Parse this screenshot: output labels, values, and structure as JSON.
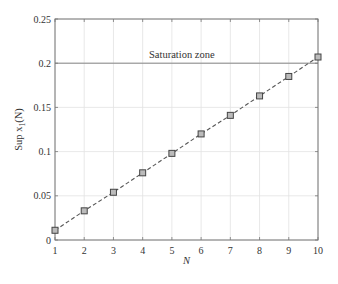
{
  "chart_data": {
    "type": "line",
    "title": "",
    "xlabel": "N",
    "ylabel": "Sup x1(N)",
    "ylabel_main": "Sup x",
    "ylabel_sub": "1",
    "ylabel_tail": "(N)",
    "x": [
      1,
      2,
      3,
      4,
      5,
      6,
      7,
      8,
      9,
      10
    ],
    "series": [
      {
        "name": "Sup x1(N)",
        "values": [
          0.011,
          0.033,
          0.054,
          0.076,
          0.098,
          0.12,
          0.141,
          0.163,
          0.185,
          0.207
        ],
        "line_style": "dashed",
        "marker": "square",
        "color": "#555555"
      }
    ],
    "xlim": [
      1,
      10
    ],
    "ylim": [
      0,
      0.25
    ],
    "xticks": [
      "1",
      "2",
      "3",
      "4",
      "5",
      "6",
      "7",
      "8",
      "9",
      "10"
    ],
    "yticks": [
      "0",
      "0.05",
      "0.1",
      "0.15",
      "0.2",
      "0.25"
    ],
    "grid": true,
    "legend": null,
    "annotations": [
      {
        "text": "Saturation zone",
        "type": "horizontal-line",
        "y": 0.2
      }
    ]
  },
  "colors": {
    "axis": "#777777",
    "grid": "#e2e2e2",
    "series": "#555555",
    "marker_fill": "#bbbbbb",
    "saturation_line": "#888888"
  }
}
